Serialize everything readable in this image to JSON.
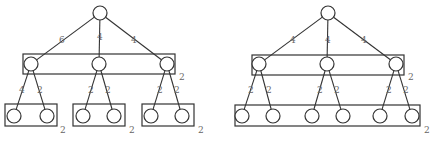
{
  "diagrams": [
    {
      "name": "left-tree",
      "root": {
        "x": 100,
        "y": 13,
        "r": 7
      },
      "mid_group": {
        "x": 23,
        "y": 54,
        "w": 152,
        "h": 20,
        "label": "2",
        "label_x": 179,
        "label_y": 80
      },
      "mid_nodes": [
        {
          "x": 31,
          "y": 64,
          "edge_label": "6",
          "label_x": 59,
          "label_y": 43
        },
        {
          "x": 99,
          "y": 64,
          "edge_label": "4",
          "label_x": 97,
          "label_y": 40
        },
        {
          "x": 167,
          "y": 64,
          "edge_label": "4",
          "label_x": 131,
          "label_y": 43
        }
      ],
      "leaf_groups": [
        {
          "x": 5,
          "y": 104,
          "w": 52,
          "h": 22,
          "label": "2",
          "label_x": 60,
          "label_y": 133
        },
        {
          "x": 73,
          "y": 104,
          "w": 52,
          "h": 22,
          "label": "2",
          "label_x": 129,
          "label_y": 133
        },
        {
          "x": 142,
          "y": 104,
          "w": 52,
          "h": 22,
          "label": "2",
          "label_x": 198,
          "label_y": 133
        }
      ],
      "leaves": [
        {
          "x": 14,
          "y": 116,
          "parent": 0,
          "edge_label": "4",
          "label_x": 19,
          "label_y": 93
        },
        {
          "x": 47,
          "y": 116,
          "parent": 0,
          "edge_label": "2",
          "label_x": 37,
          "label_y": 93
        },
        {
          "x": 83,
          "y": 116,
          "parent": 1,
          "edge_label": "2",
          "label_x": 88,
          "label_y": 93
        },
        {
          "x": 114,
          "y": 116,
          "parent": 1,
          "edge_label": "2",
          "label_x": 105,
          "label_y": 93
        },
        {
          "x": 151,
          "y": 116,
          "parent": 2,
          "edge_label": "2",
          "label_x": 157,
          "label_y": 93
        },
        {
          "x": 182,
          "y": 116,
          "parent": 2,
          "edge_label": "2",
          "label_x": 174,
          "label_y": 93
        }
      ]
    },
    {
      "name": "right-tree",
      "root": {
        "x": 328,
        "y": 13,
        "r": 7
      },
      "mid_group": {
        "x": 252,
        "y": 55,
        "w": 152,
        "h": 20,
        "label": "2",
        "label_x": 408,
        "label_y": 80
      },
      "mid_nodes": [
        {
          "x": 259,
          "y": 64,
          "edge_label": "4",
          "label_x": 290,
          "label_y": 43
        },
        {
          "x": 327,
          "y": 64,
          "edge_label": "4",
          "label_x": 325,
          "label_y": 43
        },
        {
          "x": 396,
          "y": 64,
          "edge_label": "4",
          "label_x": 361,
          "label_y": 43
        }
      ],
      "leaf_groups": [
        {
          "x": 235,
          "y": 105,
          "w": 185,
          "h": 21,
          "label": "2",
          "label_x": 424,
          "label_y": 133
        }
      ],
      "leaves": [
        {
          "x": 242,
          "y": 116,
          "parent": 0,
          "edge_label": "2",
          "label_x": 248,
          "label_y": 93
        },
        {
          "x": 273,
          "y": 116,
          "parent": 0,
          "edge_label": "2",
          "label_x": 266,
          "label_y": 93
        },
        {
          "x": 312,
          "y": 116,
          "parent": 1,
          "edge_label": "2",
          "label_x": 317,
          "label_y": 93
        },
        {
          "x": 343,
          "y": 116,
          "parent": 1,
          "edge_label": "2",
          "label_x": 334,
          "label_y": 93
        },
        {
          "x": 380,
          "y": 116,
          "parent": 2,
          "edge_label": "2",
          "label_x": 386,
          "label_y": 93
        },
        {
          "x": 412,
          "y": 116,
          "parent": 2,
          "edge_label": "2",
          "label_x": 403,
          "label_y": 93
        }
      ]
    }
  ],
  "style": {
    "line_color": "#333333",
    "label_color": "#666666",
    "node_radius": 7
  }
}
